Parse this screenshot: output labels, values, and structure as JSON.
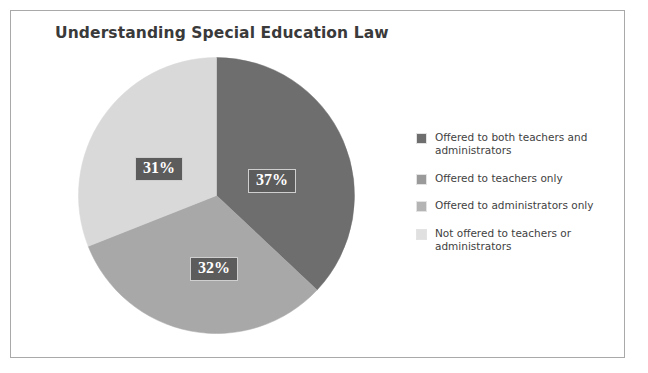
{
  "chart_data": {
    "type": "pie",
    "title": "Understanding Special Education Law",
    "categories": [
      "Offered to both teachers and administrators",
      "Offered to teachers only",
      "Offered to administrators only",
      "Not offered to teachers or administrators"
    ],
    "values": [
      37,
      32,
      31,
      0
    ],
    "value_labels": [
      "37%",
      "32%",
      "31%",
      ""
    ],
    "colors": [
      "#6e6e6e",
      "#a8a8a8",
      "#d9d9d9",
      "#ececec"
    ],
    "legend_position": "right",
    "grid": false,
    "xlabel": "",
    "ylabel": "",
    "start_angle_deg": 0,
    "direction": "clockwise",
    "units": "percent"
  },
  "figure": {
    "title": "Understanding Special Education Law",
    "background_color": "#ffffff",
    "frame_color": "#a9a9a9"
  },
  "pie": {
    "slices": [
      {
        "label": "37%",
        "value": 37,
        "color": "#6e6e6e"
      },
      {
        "label": "32%",
        "value": 32,
        "color": "#a8a8a8"
      },
      {
        "label": "31%",
        "value": 31,
        "color": "#d9d9d9"
      }
    ]
  },
  "legend": {
    "items": [
      {
        "label": "Offered to both teachers and administrators",
        "color": "#6e6e6e"
      },
      {
        "label": "Offered to teachers only",
        "color": "#9a9a9a"
      },
      {
        "label": "Offered to administrators only",
        "color": "#b4b4b4"
      },
      {
        "label": "Not offered to teachers or administrators",
        "color": "#e0e0e0"
      }
    ]
  }
}
